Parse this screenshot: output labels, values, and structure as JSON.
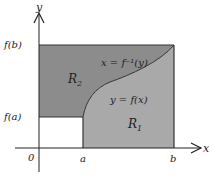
{
  "diagram": {
    "axes": {
      "x_label": "x",
      "y_label": "y",
      "origin_label": "0"
    },
    "ticks": {
      "x": [
        {
          "label": "a"
        },
        {
          "label": "b"
        }
      ],
      "y": [
        {
          "label": "f(a)"
        },
        {
          "label": "f(b)"
        }
      ]
    },
    "regions": {
      "r1": {
        "label": "R",
        "subscript": "1",
        "color": "#a9a9a9"
      },
      "r2": {
        "label": "R",
        "subscript": "2",
        "color": "#8c8c8c"
      }
    },
    "curve": {
      "label_inverse": "x = f⁻¹(y)",
      "label_function": "y = f(x)"
    },
    "colors": {
      "axis": "#222222",
      "border": "#333333",
      "background": "#ffffff"
    }
  }
}
